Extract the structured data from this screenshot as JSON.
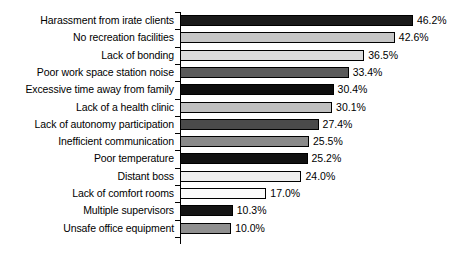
{
  "chart_data": {
    "type": "bar",
    "orientation": "horizontal",
    "title": "",
    "subtitle": "",
    "xlabel": "",
    "ylabel": "",
    "xlim": [
      0,
      50
    ],
    "grid": false,
    "legend": "none",
    "value_suffix": "%",
    "categories": [
      "Harassment from irate clients",
      "No recreation facilities",
      "Lack of bonding",
      "Poor work space station noise",
      "Excessive time away from family",
      "Lack of a health clinic",
      "Lack of autonomy participation",
      "Inefficient communication",
      "Poor temperature",
      "Distant boss",
      "Lack of comfort rooms",
      "Multiple supervisors",
      "Unsafe office equipment"
    ],
    "values": [
      46.2,
      42.6,
      36.5,
      33.4,
      30.4,
      30.1,
      27.4,
      25.5,
      25.2,
      24.0,
      17.0,
      10.3,
      10.0
    ],
    "value_labels": [
      "46.2%",
      "42.6%",
      "36.5%",
      "33.4%",
      "30.4%",
      "30.1%",
      "27.4%",
      "25.5%",
      "25.2%",
      "24.0%",
      "17.0%",
      "10.3%",
      "10.0%"
    ],
    "bar_fills": [
      "#1a1a1a",
      "#c6c6c6",
      "#dcdcdc",
      "#5a5a5a",
      "#0d0d0d",
      "#c0c0c0",
      "#4a4a4a",
      "#8a8a8a",
      "#111111",
      "#efefef",
      "#fbfbfb",
      "#141414",
      "#909090"
    ]
  }
}
